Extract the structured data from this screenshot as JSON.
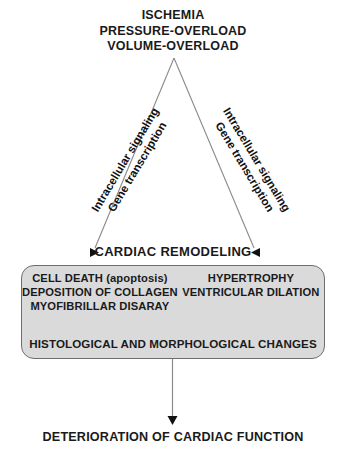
{
  "diagram": {
    "title_block": {
      "line1": "ISCHEMIA",
      "line2": "PRESSURE-OVERLOAD",
      "line3": "VOLUME-OVERLOAD"
    },
    "branches": {
      "left": {
        "line1": "Intracellular signaling",
        "line2": "Gene transcription"
      },
      "right": {
        "line1": "Intracellular signaling",
        "line2": "Gene transcription"
      }
    },
    "remodeling_title": "CARDIAC REMODELING",
    "box": {
      "left_column": [
        "CELL DEATH (apoptosis)",
        "DEPOSITION OF COLLAGEN",
        "MYOFIBRILLAR DISARAY"
      ],
      "right_column": [
        "HYPERTROPHY",
        "VENTRICULAR DILATION"
      ],
      "summary": "HISTOLOGICAL AND MORPHOLOGICAL CHANGES",
      "fill_color": "#dadada",
      "border_color": "#6e6e6e"
    },
    "outcome": "DETERIORATION OF CARDIAC FUNCTION",
    "line_color": "#8a8a8a",
    "arrow_color": "#111111",
    "background": "#ffffff"
  }
}
